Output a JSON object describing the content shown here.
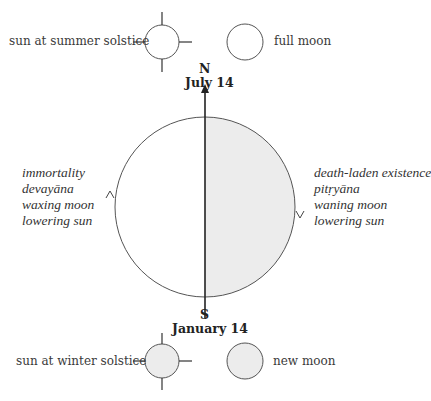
{
  "legend": {
    "top_left": {
      "label": "sun at summer solstice",
      "icon": "sun-open-icon"
    },
    "top_right": {
      "label": "full moon",
      "icon": "full-moon-icon"
    },
    "bottom_left": {
      "label": "sun at winter solstice",
      "icon": "sun-shaded-icon"
    },
    "bottom_right": {
      "label": "new moon",
      "icon": "new-moon-icon"
    }
  },
  "axis": {
    "north": {
      "letter": "N",
      "date": "July 14"
    },
    "south": {
      "letter": "S",
      "date": "January 14"
    }
  },
  "left_half": {
    "lines": [
      "immortality",
      "devayāna",
      "waxing moon",
      "lowering sun"
    ],
    "arrow_direction": "up"
  },
  "right_half": {
    "lines": [
      "death-laden existence",
      "pitṛyāna",
      "waning moon",
      "lowering sun"
    ],
    "arrow_direction": "down",
    "fill": "#ececec"
  },
  "colors": {
    "stroke": "#555555",
    "shade": "#ececec"
  }
}
